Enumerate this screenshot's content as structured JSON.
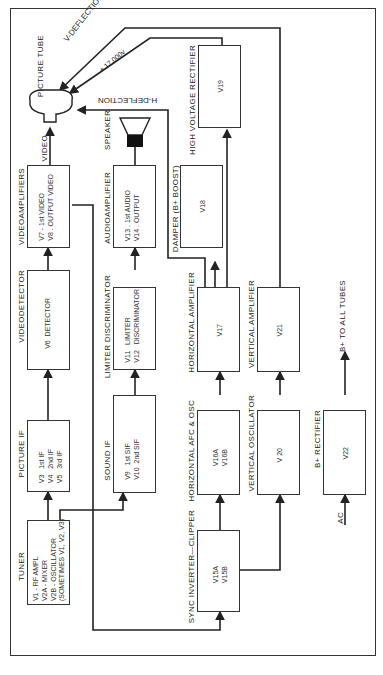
{
  "diagram": {
    "orientation": "rotated 90 degrees counterclockwise",
    "blocks": {
      "tuner": {
        "label": "TUNER",
        "content": "V1 - RF AMPL\nV2A - MIXER\nV2B - OSCILLATOR\n(SOMETIMES V1, V2, V3)"
      },
      "picture_if": {
        "label": "PICTURE IF",
        "content": "V3   1st IF\nV4   2nd IF\nV5   3rd IF"
      },
      "video_detector": {
        "label": "VIDEODETECTOR",
        "content": "V6  DETECTOR"
      },
      "video_amplifiers": {
        "label": "VIDEOAMPLIFIERS",
        "content": "V7 - 1st VIDEO\nV8 . OUTPUT VIDEO"
      },
      "picture_tube": {
        "label": "PICTURE TUBE"
      },
      "sound_if": {
        "label": "SOUND IF",
        "content": "V9   1st SIF\nV10  2nd SIF"
      },
      "limiter_discriminator": {
        "label": "LIMITER DISCRIMINATOR",
        "content": "V11   LIMITER\nV12   DISCRIMINATOR"
      },
      "audio_amplifier": {
        "label": "AUDIOAMPLIFIER",
        "content": "V13 . 1st AUDIO\nV14 . OUTPUT"
      },
      "speaker": {
        "label": "SPEAKER"
      },
      "sync_inverter_clipper": {
        "label": "SYNC INVERTER—CLIPPER",
        "content": "V15A\nV15B"
      },
      "horizontal_afc_osc": {
        "label": "HORIZONTAL AFC & OSC",
        "content": "V16A\nV16B"
      },
      "horizontal_amplifier": {
        "label": "HORIZONTAL AMPLIFIER",
        "content": "V17"
      },
      "damper": {
        "label": "DAMPER (B+ BOOST)",
        "content": "V18"
      },
      "high_voltage_rectifier": {
        "label": "HIGH VOLTAGE RECTIFIER",
        "content": "V19"
      },
      "vertical_oscillator": {
        "label": "VERTICAL OSCILLATOR",
        "content": "V 20"
      },
      "vertical_amplifier": {
        "label": "VERTICAL AMPLIFIER",
        "content": "V21"
      },
      "b_plus_rectifier": {
        "label": "B+ RECTIFIER",
        "content": "V22"
      }
    },
    "signal_labels": {
      "video": "VIDEO",
      "v_deflection": "V-DEFLECTION",
      "h_deflection": "H-DEFLECTION",
      "high_voltage": "+ 17,000v",
      "b_plus": "B+ TO ALL TUBES",
      "ac": "AC"
    }
  }
}
